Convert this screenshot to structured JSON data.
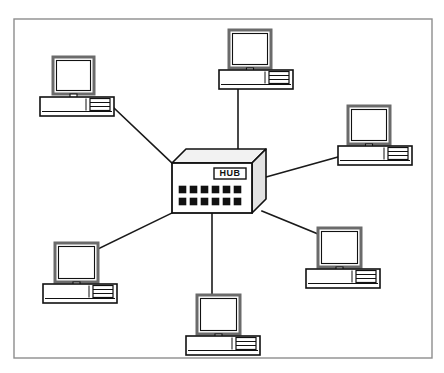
{
  "diagram": {
    "type": "network-topology",
    "topology": "star",
    "background_color": "#ffffff",
    "frame": {
      "name": "diagram-border",
      "x": 14,
      "y": 19,
      "width": 418,
      "height": 339,
      "stroke_color": "#8d8d8d",
      "stroke_width": 1.4,
      "fill": "none"
    },
    "palette": {
      "line_color": "#1a1a1a",
      "device_outline": "#111111",
      "monitor_bezel": "#6b6b6b",
      "screen_fill": "#ffffff",
      "case_fill": "#ffffff",
      "port_fill": "#111111",
      "hub_top_fill": "#f2f2f2",
      "hub_side_fill": "#e2e2e2",
      "hub_face_fill": "#ffffff"
    },
    "hub": {
      "name": "network-hub",
      "label": "HUB",
      "ports_columns": 6,
      "ports_rows": 2,
      "ports_total": 12,
      "face": {
        "x": 172,
        "y": 163,
        "width": 80,
        "height": 50
      },
      "depth_x": 14,
      "depth_y": -14,
      "label_box": {
        "x": 214,
        "y": 168,
        "width": 32,
        "height": 11
      },
      "port": {
        "size": 7,
        "gap_x": 11,
        "gap_y": 12,
        "start_x": 179,
        "start_y": 186
      }
    },
    "workstations": [
      {
        "id": "ws-top-left",
        "name": "workstation-top-left",
        "monitor": {
          "x": 53,
          "y": 57,
          "width": 41,
          "height": 37
        },
        "case": {
          "x": 40,
          "y": 97,
          "width": 74,
          "height": 19
        },
        "link_from": [
          114,
          108
        ],
        "link_to": [
          172,
          163
        ]
      },
      {
        "id": "ws-top-center",
        "name": "workstation-top-center",
        "monitor": {
          "x": 229,
          "y": 30,
          "width": 42,
          "height": 38
        },
        "case": {
          "x": 219,
          "y": 70,
          "width": 74,
          "height": 19
        },
        "link_from": [
          238,
          89
        ],
        "link_to": [
          238,
          149
        ]
      },
      {
        "id": "ws-right-upper",
        "name": "workstation-right-upper",
        "monitor": {
          "x": 348,
          "y": 106,
          "width": 42,
          "height": 38
        },
        "case": {
          "x": 338,
          "y": 146,
          "width": 74,
          "height": 19
        },
        "link_from": [
          338,
          157
        ],
        "link_to": [
          266,
          177
        ]
      },
      {
        "id": "ws-right-lower",
        "name": "workstation-right-lower",
        "monitor": {
          "x": 318,
          "y": 228,
          "width": 43,
          "height": 39
        },
        "case": {
          "x": 306,
          "y": 269,
          "width": 74,
          "height": 19
        },
        "link_from": [
          318,
          234
        ],
        "link_to": [
          262,
          211
        ]
      },
      {
        "id": "ws-bottom-center",
        "name": "workstation-bottom-center",
        "monitor": {
          "x": 197,
          "y": 295,
          "width": 43,
          "height": 39
        },
        "case": {
          "x": 186,
          "y": 336,
          "width": 74,
          "height": 19
        },
        "link_from": [
          212,
          295
        ],
        "link_to": [
          212,
          213
        ]
      },
      {
        "id": "ws-bottom-left",
        "name": "workstation-bottom-left",
        "monitor": {
          "x": 55,
          "y": 243,
          "width": 43,
          "height": 39
        },
        "case": {
          "x": 43,
          "y": 284,
          "width": 74,
          "height": 19
        },
        "link_from": [
          98,
          249
        ],
        "link_to": [
          172,
          213
        ]
      }
    ],
    "links": [
      {
        "id": "link-top-left",
        "name": "cable-top-left"
      },
      {
        "id": "link-top-center",
        "name": "cable-top-center"
      },
      {
        "id": "link-right-upper",
        "name": "cable-right-upper"
      },
      {
        "id": "link-right-lower",
        "name": "cable-right-lower"
      },
      {
        "id": "link-bottom-center",
        "name": "cable-bottom-center"
      },
      {
        "id": "link-bottom-left",
        "name": "cable-bottom-left"
      }
    ]
  }
}
